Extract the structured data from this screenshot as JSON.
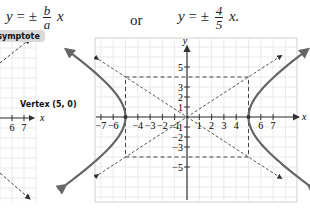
{
  "equations": {
    "general": {
      "lhs": "y",
      "op": "= ±",
      "numerator": "b",
      "denominator": "a",
      "var": "x"
    },
    "connector": "or",
    "specific": {
      "lhs": "y",
      "op": "= ±",
      "numerator": "4",
      "denominator": "5",
      "var": "x."
    }
  },
  "left_graph": {
    "asymptote_label": "Asymptote",
    "vertex_label": "Vertex (5, 0)",
    "x_ticks": [
      "6",
      "7"
    ],
    "x_axis_label": "x"
  },
  "right_graph": {
    "x_axis_label": "x",
    "y_axis_label": "y",
    "x_tick_labels": [
      "−7",
      "−6",
      "−4",
      "−3",
      "−2",
      "−1",
      "1",
      "2",
      "3",
      "4",
      "6",
      "7"
    ],
    "x_tick_values": [
      -7,
      -6,
      -4,
      -3,
      -2,
      -1,
      1,
      2,
      3,
      4,
      6,
      7
    ],
    "y_tick_labels": [
      "5",
      "3",
      "2",
      "1",
      "−1",
      "−2",
      "−3",
      "−5"
    ],
    "y_tick_values": [
      5,
      3,
      2,
      1,
      -1,
      -2,
      -3,
      -5
    ],
    "x_range": [
      -7.5,
      8.8
    ],
    "y_range": [
      -7.5,
      7.9
    ],
    "hyperbola": {
      "a": 5,
      "b": 4,
      "equation": "x^2/25 - y^2/16 = 1",
      "vertices": [
        [
          -5,
          0
        ],
        [
          5,
          0
        ]
      ]
    },
    "asymptote_slopes": [
      0.8,
      -0.8
    ],
    "central_rectangle": {
      "x": [
        -5,
        5
      ],
      "y": [
        -4,
        4
      ]
    },
    "colors": {
      "curve": "#666666",
      "dashed": "#444444",
      "grid": "#e3e3e3",
      "axis": "#333333"
    }
  }
}
